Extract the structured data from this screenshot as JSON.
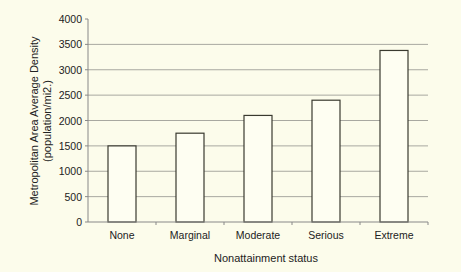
{
  "chart_data": {
    "type": "bar",
    "title": "",
    "xlabel": "Nonattainment status",
    "ylabel_line1": "Metropolitan Area Average Density",
    "ylabel_line2": "(population/mi2.)",
    "categories": [
      "None",
      "Marginal",
      "Moderate",
      "Serious",
      "Extreme"
    ],
    "values": [
      1500,
      1750,
      2100,
      2400,
      3380
    ],
    "ylim": [
      0,
      4000
    ],
    "yticks": [
      0,
      500,
      1000,
      1500,
      2000,
      2500,
      3000,
      3500,
      4000
    ],
    "grid": true,
    "legend": "none",
    "colors": {
      "background": "#fcfceb",
      "bar_fill": "#fefef2",
      "bar_stroke": "#3a3a30",
      "grid": "#a8a8a0",
      "axis": "#888888"
    }
  }
}
